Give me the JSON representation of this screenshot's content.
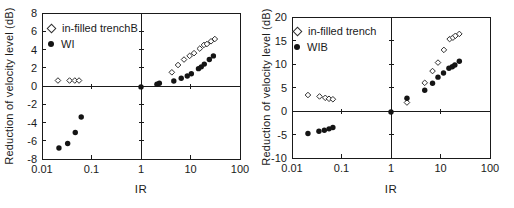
{
  "figure": {
    "background": "#ffffff",
    "ink": "#1a1a1a",
    "marker_fill": "#141414"
  },
  "chart_data": [
    {
      "type": "scatter",
      "title": "",
      "xlabel": "IR",
      "ylabel": "Reduction of velocity level (dB)",
      "x_scale": "log",
      "xlim": [
        0.01,
        100
      ],
      "ylim": [
        -8,
        8
      ],
      "x_ticks": [
        0.01,
        0.1,
        1,
        10,
        100
      ],
      "x_tick_labels": [
        "0.01",
        "0.1",
        "1",
        "10",
        "100"
      ],
      "y_ticks": [
        8,
        6,
        4,
        2,
        0,
        -2,
        -4,
        -6,
        -8
      ],
      "axis_cross": {
        "x": 1,
        "y": 0
      },
      "grid": false,
      "legend_position": "top-left-inside",
      "legend": [
        {
          "label": "in-filled trenchB",
          "marker": "open-diamond"
        },
        {
          "label": "WI",
          "marker": "filled-circle"
        }
      ],
      "series": [
        {
          "name": "in-filled trenchB",
          "marker": "open-diamond",
          "points": [
            [
              0.021,
              0.6
            ],
            [
              0.036,
              0.6
            ],
            [
              0.046,
              0.6
            ],
            [
              0.056,
              0.6
            ],
            [
              4.2,
              1.5
            ],
            [
              5.6,
              2.3
            ],
            [
              7.4,
              2.9
            ],
            [
              9.6,
              3.3
            ],
            [
              11.8,
              3.6
            ],
            [
              15.4,
              4.1
            ],
            [
              18.7,
              4.5
            ],
            [
              21.5,
              4.6
            ],
            [
              26,
              4.9
            ],
            [
              31,
              5.15
            ]
          ]
        },
        {
          "name": "WI",
          "marker": "filled-circle",
          "points": [
            [
              0.022,
              -6.8
            ],
            [
              0.033,
              -6.3
            ],
            [
              0.047,
              -5.1
            ],
            [
              0.062,
              -3.4
            ],
            [
              1,
              -0.1
            ],
            [
              2.1,
              0.2
            ],
            [
              2.35,
              0.3
            ],
            [
              4.6,
              0.55
            ],
            [
              6.5,
              0.85
            ],
            [
              8.6,
              1.1
            ],
            [
              10.4,
              1.35
            ],
            [
              14.5,
              1.9
            ],
            [
              16.5,
              2.1
            ],
            [
              19,
              2.4
            ],
            [
              24,
              2.9
            ],
            [
              29,
              3.3
            ]
          ]
        }
      ]
    },
    {
      "type": "scatter",
      "title": "",
      "xlabel": "IR",
      "ylabel": "Reduction of velocity level (dB)",
      "x_scale": "log",
      "xlim": [
        0.01,
        100
      ],
      "ylim": [
        -10,
        20
      ],
      "x_ticks": [
        0.01,
        0.1,
        1,
        10,
        100
      ],
      "x_tick_labels": [
        "0.01",
        "0.1",
        "1",
        "10",
        "100"
      ],
      "y_ticks": [
        20,
        15,
        10,
        5,
        0,
        -5,
        -10
      ],
      "axis_cross": {
        "x": 1,
        "y": 0
      },
      "grid": false,
      "legend_position": "top-left-inside",
      "legend": [
        {
          "label": "in-filled trench",
          "marker": "open-diamond"
        },
        {
          "label": "WIB",
          "marker": "filled-circle"
        }
      ],
      "series": [
        {
          "name": "in-filled trench",
          "marker": "open-diamond",
          "points": [
            [
              0.021,
              3.4
            ],
            [
              0.036,
              3.1
            ],
            [
              0.047,
              2.8
            ],
            [
              0.056,
              2.6
            ],
            [
              0.067,
              2.5
            ],
            [
              2.1,
              1.8
            ],
            [
              4.8,
              6.0
            ],
            [
              6.9,
              8.5
            ],
            [
              8.9,
              10.3
            ],
            [
              11.7,
              13.0
            ],
            [
              15.3,
              15.3
            ],
            [
              17.8,
              15.6
            ],
            [
              20,
              16.0
            ],
            [
              24,
              16.4
            ]
          ]
        },
        {
          "name": "WIB",
          "marker": "filled-circle",
          "points": [
            [
              0.021,
              -4.8
            ],
            [
              0.035,
              -4.3
            ],
            [
              0.045,
              -4.1
            ],
            [
              0.056,
              -3.8
            ],
            [
              0.067,
              -3.5
            ],
            [
              1,
              -0.2
            ],
            [
              2.1,
              2.7
            ],
            [
              4.8,
              4.4
            ],
            [
              6.9,
              5.9
            ],
            [
              8.9,
              7.2
            ],
            [
              11.5,
              8.1
            ],
            [
              14.8,
              9.1
            ],
            [
              17.3,
              9.4
            ],
            [
              19.5,
              9.8
            ],
            [
              24,
              10.6
            ]
          ]
        }
      ]
    }
  ]
}
